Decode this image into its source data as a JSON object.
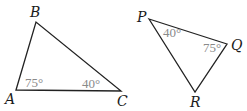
{
  "diagram": {
    "triangles": [
      {
        "name": "ABC",
        "vertices": [
          {
            "label": "A",
            "x": 16,
            "y": 90
          },
          {
            "label": "B",
            "x": 36,
            "y": 22
          },
          {
            "label": "C",
            "x": 121,
            "y": 91
          }
        ],
        "angles": [
          {
            "at": "A",
            "label": "75°"
          },
          {
            "at": "C",
            "label": "40°"
          }
        ]
      },
      {
        "name": "PQR",
        "vertices": [
          {
            "label": "P",
            "x": 149,
            "y": 19
          },
          {
            "label": "Q",
            "x": 227,
            "y": 44
          },
          {
            "label": "R",
            "x": 195,
            "y": 92
          }
        ],
        "angles": [
          {
            "at": "P",
            "label": "40°"
          },
          {
            "at": "Q",
            "label": "75°"
          }
        ]
      }
    ]
  }
}
